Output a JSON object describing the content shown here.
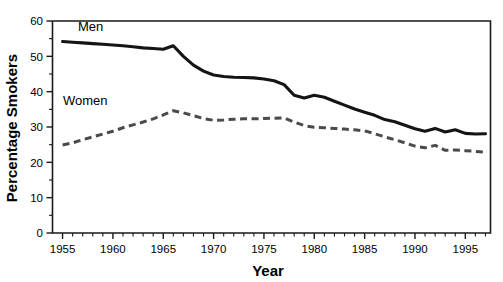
{
  "chart_data": {
    "type": "line",
    "title": "",
    "subtitle": "",
    "xlabel": "Year",
    "ylabel": "Percentage Smokers",
    "xlim": [
      1954,
      1997.5
    ],
    "ylim": [
      0,
      60
    ],
    "grid": false,
    "legend_position": "inline-annotation",
    "x_ticks_major": [
      1955,
      1960,
      1965,
      1970,
      1975,
      1980,
      1985,
      1990,
      1995
    ],
    "x_tick_labels": [
      "1955",
      "1960",
      "1965",
      "1970",
      "1975",
      "1980",
      "1985",
      "1990",
      "1995"
    ],
    "x_minor_tick_step": 1,
    "y_ticks_major": [
      0,
      10,
      20,
      30,
      40,
      50,
      60
    ],
    "y_tick_labels": [
      "0",
      "10",
      "20",
      "30",
      "40",
      "50",
      "60"
    ],
    "y_minor_tick_step": 5,
    "x": [
      1955,
      1956,
      1957,
      1958,
      1959,
      1960,
      1961,
      1962,
      1963,
      1964,
      1965,
      1966,
      1967,
      1968,
      1969,
      1970,
      1971,
      1972,
      1973,
      1974,
      1975,
      1976,
      1977,
      1978,
      1979,
      1980,
      1981,
      1982,
      1983,
      1984,
      1985,
      1986,
      1987,
      1988,
      1989,
      1990,
      1991,
      1992,
      1993,
      1994,
      1995,
      1996,
      1997
    ],
    "series": [
      {
        "name": "Men",
        "style": "solid",
        "color": "#141414",
        "values": [
          54.2,
          54.0,
          53.8,
          53.6,
          53.4,
          53.2,
          53.0,
          52.7,
          52.4,
          52.2,
          52.0,
          53.0,
          50.0,
          47.5,
          45.8,
          44.7,
          44.3,
          44.1,
          44.0,
          43.9,
          43.6,
          43.1,
          42.0,
          39.0,
          38.2,
          39.0,
          38.4,
          37.3,
          36.2,
          35.1,
          34.2,
          33.3,
          32.1,
          31.5,
          30.5,
          29.5,
          28.8,
          29.6,
          28.6,
          29.2,
          28.2,
          28.0,
          28.1
        ]
      },
      {
        "name": "Women",
        "style": "dashed",
        "color": "#4a4a4a",
        "values": [
          24.9,
          25.5,
          26.4,
          27.2,
          28.0,
          28.8,
          29.8,
          30.6,
          31.4,
          32.3,
          33.4,
          34.6,
          34.0,
          33.2,
          32.4,
          31.9,
          32.0,
          32.2,
          32.3,
          32.3,
          32.4,
          32.5,
          32.6,
          31.4,
          30.4,
          29.9,
          29.8,
          29.6,
          29.4,
          29.2,
          28.9,
          28.1,
          27.2,
          26.4,
          25.5,
          24.6,
          24.1,
          24.8,
          23.4,
          23.5,
          23.3,
          23.1,
          22.9
        ]
      }
    ]
  },
  "annotations": {
    "men_label": "Men",
    "women_label": "Women"
  }
}
